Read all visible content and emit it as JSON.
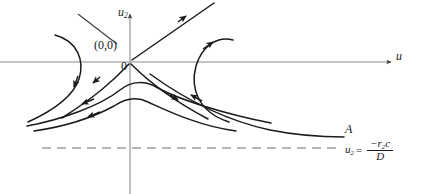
{
  "figure": {
    "type": "phase-plane-saddle-diagram",
    "width": 421,
    "height": 194,
    "background": "#ffffff",
    "curve_color": "#1a1a1a",
    "axis_color": "#808080",
    "dashed_color": "#6e6e6e"
  },
  "axes": {
    "vertical_label_base": "u",
    "vertical_label_sub": "2",
    "horizontal_label": "u",
    "origin_x": 130,
    "origin_y": 62,
    "vertical_axis_top": 12,
    "vertical_axis_bottom": 194,
    "horizontal_axis_left": 0,
    "horizontal_axis_right": 393
  },
  "annotations": {
    "origin_coords": "(0,0)",
    "origin_zero": "0",
    "asymptote_point": "A"
  },
  "equation": {
    "lhs_base": "u",
    "lhs_sub": "2",
    "equals": "=",
    "numerator_base": "−r",
    "numerator_sub": "2",
    "numerator_tail": "c",
    "denominator": "D"
  },
  "dashed_asymptote": {
    "y": 148,
    "x_start": 42,
    "x_end": 340,
    "dash_pattern": "9 6"
  },
  "trajectories": [
    {
      "name": "separatrix-in-upper-right",
      "role": "unstable-manifold-upper-right",
      "arrow_direction": "outward",
      "path": "M 130 62 L 212 4"
    },
    {
      "name": "separatrix-out-lower-left",
      "role": "stable-manifold-lower-left",
      "arrow_direction": "inward",
      "path": "M 130 62 C 112 80 92 97 60 118"
    },
    {
      "name": "separatrix-out-lower-right",
      "role": "stable-manifold-lower-right",
      "arrow_direction": "inward",
      "path": "M 130 62 C 150 82 170 99 206 118"
    },
    {
      "name": "upper-left-trajectory",
      "role": "orbit",
      "arrow_direction": "downward",
      "path": "M 56 36 C 76 42 84 60 78 78 C 72 96 48 112 26 122"
    },
    {
      "name": "upper-right-trajectory",
      "role": "orbit",
      "arrow_direction": "upward-right",
      "path": "M 225 124 C 196 112 190 86 196 64 C 202 44 216 36 230 40"
    },
    {
      "name": "hump-trajectory-inner",
      "role": "orbit",
      "arrow_direction": "leftward",
      "path": "M 268 122 C 218 112 170 96 152 85 C 140 79 130 80 118 88 C 98 102 58 118 26 126"
    },
    {
      "name": "hump-trajectory-outer",
      "role": "orbit",
      "arrow_direction": "leftward",
      "path": "M 234 130 C 196 124 162 108 146 100 C 136 96 126 97 114 104 C 92 116 62 126 34 130"
    },
    {
      "name": "asymptotic-trajectory-to-A",
      "role": "orbit-approaching-asymptote",
      "path": "M 148 72 C 188 100 226 120 268 129 C 300 135 326 136 344 136"
    }
  ],
  "arrows": [
    {
      "name": "arrow-axis-u2",
      "at": [
        130,
        12
      ],
      "dir": "up"
    },
    {
      "name": "arrow-axis-u",
      "at": [
        393,
        62
      ],
      "dir": "right"
    },
    {
      "name": "arrow-separatrix-upper-right",
      "at": [
        185,
        23
      ],
      "dir": "up-right"
    },
    {
      "name": "arrow-separatrix-lower-left",
      "at": [
        110,
        83
      ],
      "dir": "down-left"
    },
    {
      "name": "arrow-separatrix-lower-right",
      "at": [
        180,
        103
      ],
      "dir": "down-right"
    },
    {
      "name": "arrow-upper-left-orbit",
      "at": [
        74,
        85
      ],
      "dir": "down"
    },
    {
      "name": "arrow-upper-right-orbit",
      "at": [
        215,
        43
      ],
      "dir": "up-right"
    },
    {
      "name": "arrow-hump-inner",
      "at": [
        82,
        101
      ],
      "dir": "left-down"
    },
    {
      "name": "arrow-hump-outer",
      "at": [
        90,
        112
      ],
      "dir": "left-down"
    },
    {
      "name": "arrow-hump-right-inner",
      "at": [
        190,
        94
      ],
      "dir": "left-up"
    }
  ],
  "leader_line": {
    "name": "origin-leader-line",
    "from": [
      78,
      14
    ],
    "to": [
      116,
      44
    ]
  }
}
